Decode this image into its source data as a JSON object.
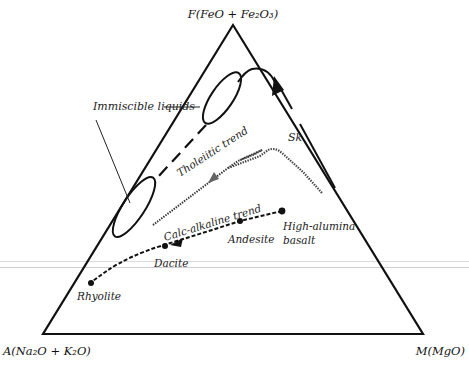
{
  "diagram": {
    "vertices": {
      "top": {
        "label": "F(FeO + Fe₂O₃)"
      },
      "bottom_left": {
        "label": "A(Na₂O + K₂O)"
      },
      "bottom_right": {
        "label": "M(MgO)"
      }
    },
    "labels": {
      "immiscible": "Immiscible liquids",
      "sk": "Sk",
      "tholeiitic": "Tholeiitic trend",
      "calc_alkaline": "Calc-alkaline trend",
      "high_alumina_1": "High-alumina",
      "high_alumina_2": "basalt",
      "andesite": "Andesite",
      "dacite": "Dacite",
      "rhyolite": "Rhyolite"
    },
    "colors": {
      "line": "#111111",
      "background": "#ffffff",
      "scan_line": "#dcdcdc"
    }
  }
}
